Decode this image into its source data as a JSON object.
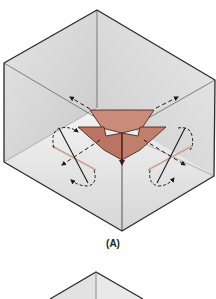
{
  "figure": {
    "panels": [
      {
        "label": "(A)",
        "description": "Isometric cube interior with three-way inward arrow at corner, dashed directional arrows and rotation indicators"
      },
      {
        "label": "",
        "description": "Second cube (partially visible, cropped at bottom)"
      }
    ],
    "colors": {
      "cube_fill_light": "#ececec",
      "cube_fill_dark": "#cfcfcf",
      "edge": "#2a2a2a",
      "arrow_fill": "#c98b7a",
      "arrow_fill_dark": "#b97462",
      "arrow_stroke": "#4a2a22",
      "rotation_axis_tint": "#c9a496"
    }
  }
}
